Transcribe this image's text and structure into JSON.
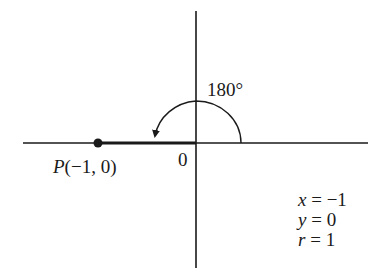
{
  "diagram": {
    "type": "unit-circle-angle",
    "angle_label": "180°",
    "origin_label": "0",
    "point": {
      "name": "P",
      "coords_text": "(−1, 0)"
    },
    "equations": [
      {
        "var": "x",
        "op": " = ",
        "value": "−1"
      },
      {
        "var": "y",
        "op": " = ",
        "value": "0"
      },
      {
        "var": "r",
        "op": " = ",
        "value": "1"
      }
    ],
    "colors": {
      "ink": "#1a1a1a",
      "background": "#ffffff"
    }
  }
}
